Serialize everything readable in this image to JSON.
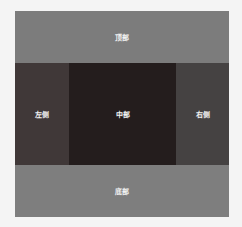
{
  "layout": {
    "top": {
      "label": "顶部",
      "color": "#7c7c7c"
    },
    "left": {
      "label": "左侧",
      "color": "#403838"
    },
    "center": {
      "label": "中部",
      "color": "#241d1d"
    },
    "right": {
      "label": "右侧",
      "color": "#454242"
    },
    "bottom": {
      "label": "底部",
      "color": "#7e7e7e"
    }
  }
}
